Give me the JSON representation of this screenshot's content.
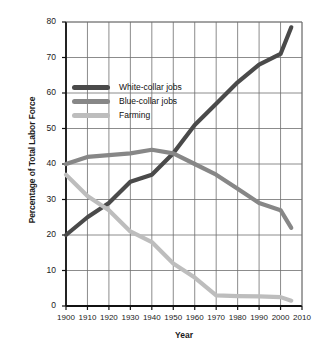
{
  "chart_data": {
    "type": "line",
    "title": "",
    "xlabel": "Year",
    "ylabel": "Percentage of Total Labor Force",
    "xlim": [
      1900,
      2010
    ],
    "ylim": [
      0,
      80
    ],
    "xticks": [
      1900,
      1910,
      1920,
      1930,
      1940,
      1950,
      1960,
      1970,
      1980,
      1990,
      2000,
      2010
    ],
    "yticks": [
      0,
      10,
      20,
      30,
      40,
      50,
      60,
      70,
      80
    ],
    "grid": true,
    "legend_position": "upper-left-inside",
    "x": [
      1900,
      1910,
      1920,
      1930,
      1940,
      1950,
      1960,
      1970,
      1980,
      1990,
      2000,
      2005
    ],
    "series": [
      {
        "name": "White-collar jobs",
        "color": "#4a4a4a",
        "values": [
          20,
          25,
          29,
          35,
          37,
          43,
          51,
          57,
          63,
          68,
          71,
          78.5
        ]
      },
      {
        "name": "Blue-collar jobs",
        "color": "#878787",
        "values": [
          40,
          42,
          42.5,
          43,
          44,
          43,
          40,
          37,
          33,
          29,
          27,
          22
        ]
      },
      {
        "name": "Farming",
        "color": "#bdbdbd",
        "values": [
          37,
          31,
          27,
          21,
          18,
          12,
          8,
          3,
          2.8,
          2.7,
          2.5,
          1.5
        ]
      }
    ]
  },
  "legend": {
    "items": [
      {
        "label": "White-collar jobs",
        "color": "#4a4a4a"
      },
      {
        "label": "Blue-collar jobs",
        "color": "#878787"
      },
      {
        "label": "Farming",
        "color": "#bdbdbd"
      }
    ]
  },
  "axes": {
    "x_title": "Year",
    "y_title": "Percentage of Total Labor Force",
    "x_tick_labels": [
      "1900",
      "1910",
      "1920",
      "1930",
      "1940",
      "1950",
      "1960",
      "1970",
      "1980",
      "1990",
      "2000",
      "2010"
    ],
    "y_tick_labels": [
      "0",
      "10",
      "20",
      "30",
      "40",
      "50",
      "60",
      "70",
      "80"
    ]
  },
  "colors": {
    "axis": "#111111",
    "grid": "#6e6e6e",
    "background": "#ffffff",
    "text": "#1a1a1a"
  }
}
